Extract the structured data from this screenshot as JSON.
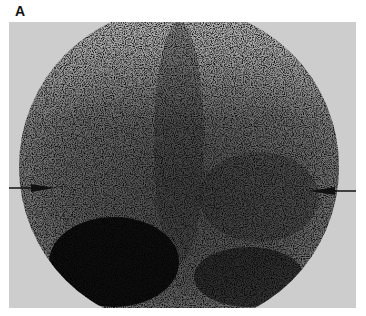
{
  "figure": {
    "panel_label": "A",
    "image": {
      "description": "Grayscale scintigraphy scan with circular field of view showing diffuse tracer uptake and a dense dark region at lower left",
      "background_color": "#cfcfcf",
      "dark_region_color": "#0e0e0e"
    },
    "annotations": [
      {
        "type": "arrow",
        "direction": "right",
        "side": "left",
        "y_px": 189
      },
      {
        "type": "arrow",
        "direction": "left",
        "side": "right",
        "y_px": 191
      }
    ]
  }
}
